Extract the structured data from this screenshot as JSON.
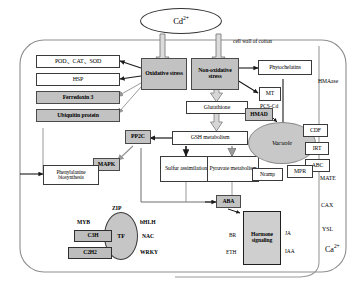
{
  "diagram": {
    "cell_wall_label": "cell wall of cotton",
    "colors": {
      "gray_fill": "#c2c2c2",
      "white_fill": "#ffffff",
      "stroke": "#3a3a3a",
      "vacuole_fill": "#c8c8c8"
    }
  },
  "input": {
    "cadmium": "Cd2+",
    "cadmium_html": "Cd<sup>2+</sup>"
  },
  "stress": {
    "oxidative": "Oxidative stress",
    "non_oxidative": "Non-oxidative stress"
  },
  "antioxidant_targets": [
    {
      "label": "POD、CAT、SOD",
      "fill": "white"
    },
    {
      "label": "HSP",
      "fill": "white"
    },
    {
      "label": "Ferredoxin 3",
      "fill": "gray"
    },
    {
      "label": "Ubiquitin protein",
      "fill": "gray"
    }
  ],
  "metabolism": {
    "glutathione": "Glutathione",
    "gsh_metabolism": "GSH metabolism",
    "sulfur_assimilation": "Sulfur assimilation",
    "pyruvate_metabolism": "Pyruvate metabolism",
    "phenylalanine": "Phenylalanine biosynthesis",
    "pp2c": "PP2C",
    "mapk": "MAPK"
  },
  "chelation": {
    "phytochelatins": "Phytochelatins",
    "mt": "MT",
    "pcs_cd": "PCS-Cd",
    "hmad": "HMAD",
    "vacuole": "Vacuole"
  },
  "transporters": {
    "hmaase": "HMAase",
    "cdf": "CDF",
    "irt": "IRT",
    "abc": "ABC",
    "mate": "MATE",
    "cax": "CAX",
    "ysl": "YSL",
    "nramp": "Nramp",
    "mpr": "MPR",
    "calcium": "Ca2+",
    "calcium_html": "Ca<sup>2+</sup>"
  },
  "transcription_factors": {
    "center": "TF",
    "zip": "ZIP",
    "myb": "MYB",
    "bhlh": "bHLH",
    "c3h": "C3H",
    "nac": "NAC",
    "c2h2": "C2H2",
    "wrky": "WRKY"
  },
  "hormones": {
    "aba": "ABA",
    "signaling": "Hormone signaling",
    "br": "BR",
    "eth": "ETH",
    "ja": "JA",
    "iaa": "IAA"
  }
}
